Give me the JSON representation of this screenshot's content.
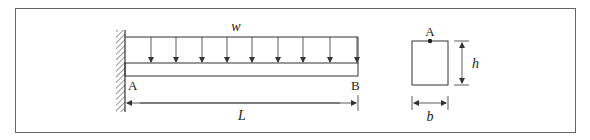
{
  "figure": {
    "type": "cantilever beam with uniformly distributed load and rectangular cross-section",
    "beam": {
      "support": "fixed wall at left end",
      "left_end_label": "A",
      "right_end_label": "B",
      "length_label": "L"
    },
    "load": {
      "label": "w",
      "kind": "uniformly distributed, downward",
      "arrow_count": 9
    },
    "cross_section": {
      "shape": "rectangle",
      "point_label": "A",
      "point_location": "top center",
      "width_label": "b",
      "height_label": "h"
    }
  },
  "colors": {
    "line": "#333333",
    "frame": "#666666",
    "background": "#ffffff"
  }
}
